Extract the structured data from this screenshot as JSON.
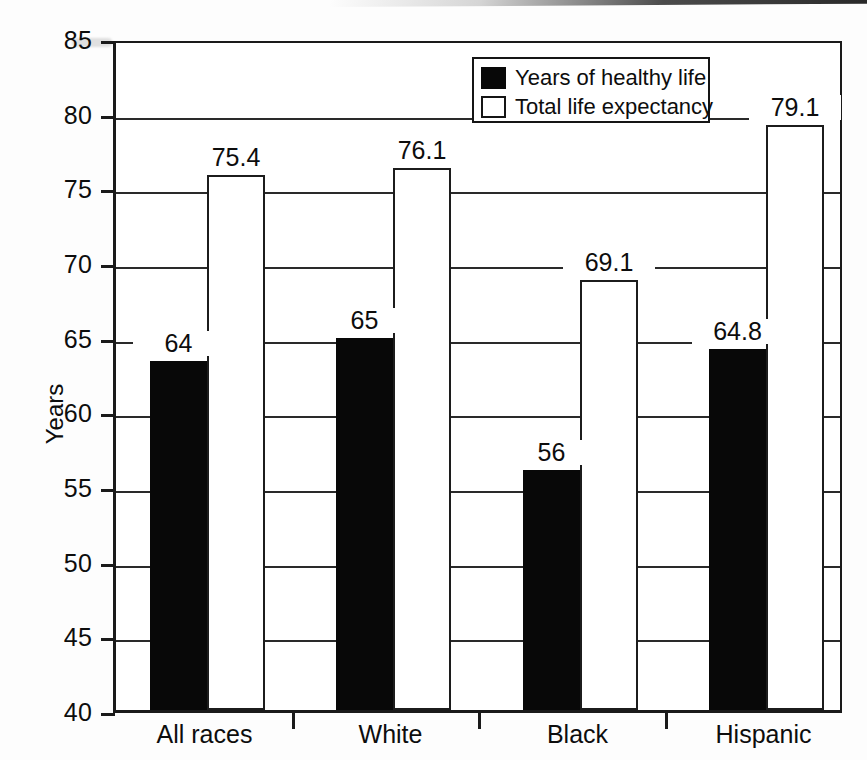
{
  "chart_data": {
    "type": "bar",
    "title": "",
    "subtitle": "",
    "xlabel": "",
    "ylabel": "Years",
    "categories": [
      "All races",
      "White",
      "Black",
      "Hispanic"
    ],
    "series": [
      {
        "name": "Years of healthy life",
        "color": "#080808",
        "style": "filled",
        "values": [
          64,
          65,
          56,
          64.8
        ],
        "plotted": [
          63.4,
          64.9,
          56.1,
          64.2
        ],
        "labels": [
          "64",
          "65",
          "56",
          "64.8"
        ]
      },
      {
        "name": "Total life expectancy",
        "color": "#ffffff",
        "style": "outlined",
        "values": [
          75.4,
          76.1,
          69.1,
          79.1
        ],
        "plotted": [
          75.8,
          76.3,
          68.8,
          79.2
        ],
        "labels": [
          "75.4",
          "76.1",
          "69.1",
          "79.1"
        ]
      }
    ],
    "ylim": [
      40,
      85
    ],
    "ytick_step": 5,
    "ytick_labels": [
      "85",
      "80",
      "75",
      "70",
      "65",
      "60",
      "55",
      "50",
      "45",
      "40"
    ],
    "ytick_values": [
      85,
      80,
      75,
      70,
      65,
      60,
      55,
      50,
      45,
      40
    ],
    "grid": true,
    "grid_axis": "y",
    "legend_position": "top-right",
    "legend_entries": [
      "Years of healthy life",
      "Total life expectancy"
    ]
  },
  "axes": {
    "y_title": "Years"
  },
  "legend": {
    "items": [
      {
        "label": "Years of healthy life",
        "swatch": "filled-black-square"
      },
      {
        "label": "Total life expectancy",
        "swatch": "outlined-white-square"
      }
    ]
  }
}
